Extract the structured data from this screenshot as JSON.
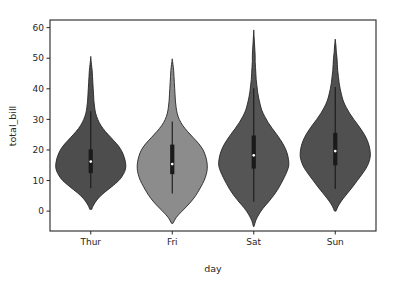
{
  "chart_data": {
    "type": "violin",
    "title": "",
    "xlabel": "day",
    "ylabel": "total_bill",
    "categories": [
      "Thur",
      "Fri",
      "Sat",
      "Sun"
    ],
    "xtick_labels": [
      "Thur",
      "Fri",
      "Sat",
      "Sun"
    ],
    "ytick_labels": [
      "0",
      "10",
      "20",
      "30",
      "40",
      "50",
      "60"
    ],
    "ytick_values": [
      0,
      10,
      20,
      30,
      40,
      50,
      60
    ],
    "ylim": [
      -6.5,
      62.5
    ],
    "xlim": [
      -0.5,
      3.5
    ],
    "grid": false,
    "legend": false,
    "series": [
      {
        "name": "Thur",
        "fill_color": "#4d4d4d",
        "edge_color": "#262626",
        "kde_min": 0.6,
        "kde_max": 50.3,
        "median": 16.2,
        "q1": 12.44,
        "q3": 20.16,
        "whisker_low": 7.51,
        "whisker_high": 32.68,
        "max_width": 0.43,
        "kde_profile": [
          [
            0.6,
            0.03
          ],
          [
            2.0,
            0.08
          ],
          [
            4.0,
            0.2
          ],
          [
            6.0,
            0.38
          ],
          [
            8.0,
            0.6
          ],
          [
            10.0,
            0.8
          ],
          [
            11.5,
            0.9
          ],
          [
            13.0,
            0.97
          ],
          [
            14.5,
            1.0
          ],
          [
            16.0,
            0.99
          ],
          [
            17.5,
            0.96
          ],
          [
            19.0,
            0.91
          ],
          [
            20.5,
            0.84
          ],
          [
            22.0,
            0.74
          ],
          [
            24.0,
            0.58
          ],
          [
            26.0,
            0.42
          ],
          [
            28.0,
            0.29
          ],
          [
            30.0,
            0.2
          ],
          [
            32.0,
            0.14
          ],
          [
            34.0,
            0.11
          ],
          [
            36.0,
            0.09
          ],
          [
            38.0,
            0.08
          ],
          [
            40.0,
            0.07
          ],
          [
            42.0,
            0.06
          ],
          [
            44.0,
            0.05
          ],
          [
            46.0,
            0.04
          ],
          [
            48.0,
            0.02
          ],
          [
            50.3,
            0.0
          ]
        ]
      },
      {
        "name": "Fri",
        "fill_color": "#8c8c8c",
        "edge_color": "#262626",
        "kde_min": -4.0,
        "kde_max": 49.6,
        "median": 15.38,
        "q1": 12.09,
        "q3": 21.75,
        "whisker_low": 5.75,
        "whisker_high": 29.3,
        "max_width": 0.43,
        "kde_profile": [
          [
            -4.0,
            0.02
          ],
          [
            -2.0,
            0.12
          ],
          [
            0.0,
            0.28
          ],
          [
            2.0,
            0.45
          ],
          [
            4.0,
            0.6
          ],
          [
            6.0,
            0.72
          ],
          [
            8.0,
            0.82
          ],
          [
            10.0,
            0.91
          ],
          [
            12.0,
            0.97
          ],
          [
            14.0,
            1.0
          ],
          [
            16.0,
            0.99
          ],
          [
            18.0,
            0.95
          ],
          [
            20.0,
            0.88
          ],
          [
            22.0,
            0.76
          ],
          [
            24.0,
            0.6
          ],
          [
            26.0,
            0.44
          ],
          [
            28.0,
            0.3
          ],
          [
            30.0,
            0.2
          ],
          [
            32.0,
            0.14
          ],
          [
            34.0,
            0.11
          ],
          [
            36.0,
            0.09
          ],
          [
            38.0,
            0.08
          ],
          [
            40.0,
            0.07
          ],
          [
            42.0,
            0.06
          ],
          [
            44.0,
            0.05
          ],
          [
            46.0,
            0.04
          ],
          [
            48.0,
            0.02
          ],
          [
            49.6,
            0.0
          ]
        ]
      },
      {
        "name": "Sat",
        "fill_color": "#555555",
        "edge_color": "#262626",
        "kde_min": -5.0,
        "kde_max": 59.0,
        "median": 18.24,
        "q1": 13.91,
        "q3": 24.74,
        "whisker_low": 3.07,
        "whisker_high": 40.17,
        "max_width": 0.43,
        "kde_profile": [
          [
            -5.0,
            0.01
          ],
          [
            -3.0,
            0.06
          ],
          [
            -1.0,
            0.15
          ],
          [
            1.0,
            0.27
          ],
          [
            3.0,
            0.42
          ],
          [
            5.0,
            0.56
          ],
          [
            7.0,
            0.68
          ],
          [
            9.0,
            0.78
          ],
          [
            11.0,
            0.87
          ],
          [
            13.0,
            0.95
          ],
          [
            15.0,
            1.0
          ],
          [
            17.0,
            0.99
          ],
          [
            19.0,
            0.95
          ],
          [
            21.0,
            0.88
          ],
          [
            23.0,
            0.78
          ],
          [
            25.0,
            0.66
          ],
          [
            27.0,
            0.53
          ],
          [
            29.0,
            0.41
          ],
          [
            31.0,
            0.31
          ],
          [
            33.0,
            0.23
          ],
          [
            35.0,
            0.18
          ],
          [
            37.0,
            0.14
          ],
          [
            39.0,
            0.11
          ],
          [
            41.0,
            0.09
          ],
          [
            43.0,
            0.07
          ],
          [
            45.0,
            0.06
          ],
          [
            47.0,
            0.05
          ],
          [
            49.0,
            0.04
          ],
          [
            51.0,
            0.04
          ],
          [
            53.0,
            0.03
          ],
          [
            55.0,
            0.02
          ],
          [
            57.0,
            0.01
          ],
          [
            59.0,
            0.0
          ]
        ]
      },
      {
        "name": "Sun",
        "fill_color": "#505050",
        "edge_color": "#262626",
        "kde_min": 0.0,
        "kde_max": 56.0,
        "median": 19.63,
        "q1": 14.99,
        "q3": 25.6,
        "whisker_low": 7.25,
        "whisker_high": 40.55,
        "max_width": 0.43,
        "kde_profile": [
          [
            0.0,
            0.02
          ],
          [
            2.0,
            0.1
          ],
          [
            4.0,
            0.22
          ],
          [
            6.0,
            0.36
          ],
          [
            8.0,
            0.5
          ],
          [
            10.0,
            0.63
          ],
          [
            12.0,
            0.76
          ],
          [
            14.0,
            0.88
          ],
          [
            16.0,
            0.96
          ],
          [
            18.0,
            1.0
          ],
          [
            20.0,
            0.99
          ],
          [
            22.0,
            0.95
          ],
          [
            24.0,
            0.88
          ],
          [
            26.0,
            0.78
          ],
          [
            28.0,
            0.66
          ],
          [
            30.0,
            0.53
          ],
          [
            32.0,
            0.41
          ],
          [
            34.0,
            0.31
          ],
          [
            36.0,
            0.23
          ],
          [
            38.0,
            0.18
          ],
          [
            40.0,
            0.14
          ],
          [
            42.0,
            0.11
          ],
          [
            44.0,
            0.09
          ],
          [
            46.0,
            0.07
          ],
          [
            48.0,
            0.06
          ],
          [
            50.0,
            0.05
          ],
          [
            52.0,
            0.03
          ],
          [
            54.0,
            0.02
          ],
          [
            56.0,
            0.0
          ]
        ]
      }
    ]
  },
  "axes": {
    "left_spine_x": 50,
    "right_spine_x": 376,
    "top_spine_y": 20,
    "bottom_spine_y": 231,
    "spine_color": "#262626",
    "tick_color": "#262626",
    "background": "#ffffff"
  }
}
